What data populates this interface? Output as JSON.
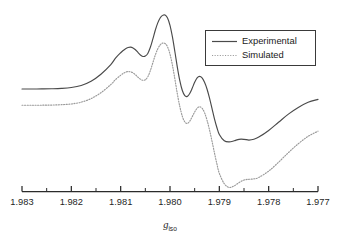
{
  "figure": {
    "kind": "epr-spectrum-figure",
    "background_color": "#ffffff"
  },
  "chart_data": {
    "type": "line",
    "title": "",
    "subtitle": "",
    "xlabel": "g_iso",
    "xlabel_base": "g",
    "xlabel_subscript": "iso",
    "ylabel": "",
    "grid": false,
    "legend_position": "top-right",
    "xlim": [
      1.983,
      1.977
    ],
    "x_axis_direction": "decreasing",
    "x_major_ticks": [
      1.983,
      1.982,
      1.981,
      1.98,
      1.979,
      1.978,
      1.977
    ],
    "x_major_tick_labels": [
      "1.983",
      "1.982",
      "1.981",
      "1.980",
      "1.979",
      "1.978",
      "1.977"
    ],
    "x_minor_ticks": [
      1.9825,
      1.9815,
      1.9805,
      1.9795,
      1.9785,
      1.9775
    ],
    "y_axis_shown": false,
    "ylim": [
      -1.0,
      1.0
    ],
    "annotations": [],
    "series": [
      {
        "name": "Experimental",
        "style": "solid",
        "color": "#4a4a4a",
        "baseline_offset": 0.0,
        "x": [
          1.983,
          1.9828,
          1.9826,
          1.9824,
          1.9822,
          1.982,
          1.9818,
          1.9816,
          1.9814,
          1.9812,
          1.9811,
          1.981,
          1.98095,
          1.9809,
          1.98085,
          1.9808,
          1.98075,
          1.9807,
          1.98065,
          1.9806,
          1.98055,
          1.9805,
          1.98045,
          1.9804,
          1.98035,
          1.9803,
          1.98025,
          1.9802,
          1.98015,
          1.9801,
          1.98005,
          1.98,
          1.97995,
          1.9799,
          1.97985,
          1.9798,
          1.97975,
          1.9797,
          1.97965,
          1.9796,
          1.97955,
          1.9795,
          1.97945,
          1.9794,
          1.97935,
          1.9793,
          1.97925,
          1.9792,
          1.97915,
          1.9791,
          1.97905,
          1.979,
          1.9789,
          1.9788,
          1.9787,
          1.9786,
          1.9785,
          1.9784,
          1.9783,
          1.9782,
          1.978,
          1.9778,
          1.9776,
          1.9774,
          1.9772,
          1.977
        ],
        "y": [
          0.0,
          0.0,
          0.001,
          0.003,
          0.008,
          0.02,
          0.048,
          0.105,
          0.2,
          0.33,
          0.42,
          0.49,
          0.52,
          0.545,
          0.56,
          0.565,
          0.555,
          0.53,
          0.495,
          0.46,
          0.44,
          0.445,
          0.48,
          0.56,
          0.67,
          0.79,
          0.89,
          0.96,
          0.995,
          1.0,
          0.96,
          0.86,
          0.7,
          0.5,
          0.29,
          0.11,
          -0.02,
          -0.09,
          -0.1,
          -0.06,
          0.01,
          0.09,
          0.15,
          0.17,
          0.15,
          0.09,
          0.0,
          -0.12,
          -0.26,
          -0.4,
          -0.52,
          -0.615,
          -0.7,
          -0.715,
          -0.7,
          -0.68,
          -0.68,
          -0.69,
          -0.68,
          -0.65,
          -0.56,
          -0.45,
          -0.34,
          -0.25,
          -0.18,
          -0.14
        ]
      },
      {
        "name": "Simulated",
        "style": "dotted",
        "color": "#9a9a9a",
        "baseline_offset": -0.22,
        "x": [
          1.983,
          1.9828,
          1.9826,
          1.9824,
          1.9822,
          1.982,
          1.9818,
          1.9816,
          1.9814,
          1.9812,
          1.9811,
          1.981,
          1.98095,
          1.9809,
          1.98085,
          1.9808,
          1.98075,
          1.9807,
          1.98065,
          1.9806,
          1.98055,
          1.9805,
          1.98045,
          1.9804,
          1.98035,
          1.9803,
          1.98025,
          1.9802,
          1.98015,
          1.9801,
          1.98005,
          1.98,
          1.97995,
          1.9799,
          1.97985,
          1.9798,
          1.97975,
          1.9797,
          1.97965,
          1.9796,
          1.97955,
          1.9795,
          1.97945,
          1.9794,
          1.97935,
          1.9793,
          1.97925,
          1.9792,
          1.97915,
          1.9791,
          1.97905,
          1.979,
          1.9789,
          1.9788,
          1.9787,
          1.9786,
          1.9785,
          1.9784,
          1.9783,
          1.9782,
          1.978,
          1.9778,
          1.9776,
          1.9774,
          1.9772,
          1.977
        ],
        "y": [
          0.0,
          0.0,
          0.001,
          0.003,
          0.008,
          0.018,
          0.042,
          0.09,
          0.17,
          0.28,
          0.35,
          0.405,
          0.43,
          0.448,
          0.455,
          0.452,
          0.438,
          0.412,
          0.38,
          0.352,
          0.338,
          0.345,
          0.385,
          0.465,
          0.57,
          0.675,
          0.76,
          0.815,
          0.84,
          0.835,
          0.79,
          0.69,
          0.54,
          0.35,
          0.15,
          -0.02,
          -0.15,
          -0.225,
          -0.245,
          -0.215,
          -0.155,
          -0.09,
          -0.04,
          -0.02,
          -0.04,
          -0.1,
          -0.2,
          -0.33,
          -0.48,
          -0.64,
          -0.79,
          -0.92,
          -1.06,
          -1.11,
          -1.09,
          -1.045,
          -1.01,
          -1.0,
          -0.995,
          -0.975,
          -0.89,
          -0.77,
          -0.64,
          -0.52,
          -0.42,
          -0.35
        ]
      }
    ]
  },
  "legend": {
    "items": [
      {
        "label": "Experimental",
        "style": "solid"
      },
      {
        "label": "Simulated",
        "style": "dotted"
      }
    ]
  },
  "axis": {
    "x_label_base": "g",
    "x_label_subscript": "iso",
    "tick_labels": [
      "1.983",
      "1.982",
      "1.981",
      "1.980",
      "1.979",
      "1.978",
      "1.977"
    ]
  }
}
